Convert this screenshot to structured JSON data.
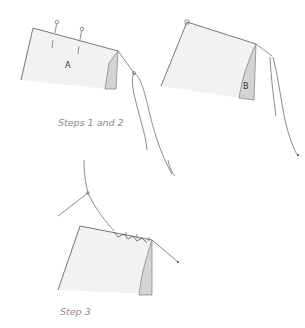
{
  "figure": {
    "panels": [
      {
        "id": "step-1",
        "label": "A"
      },
      {
        "id": "step-2",
        "label": "B"
      },
      {
        "id": "step-3",
        "label": ""
      }
    ],
    "captions": {
      "steps_1_2": "Steps 1 and 2",
      "step_3": "Step 3"
    },
    "colors": {
      "fabric": "#f2f2f2",
      "fold": "#d4d4d4",
      "line": "#555555",
      "caption": "#8a8a8a"
    }
  }
}
